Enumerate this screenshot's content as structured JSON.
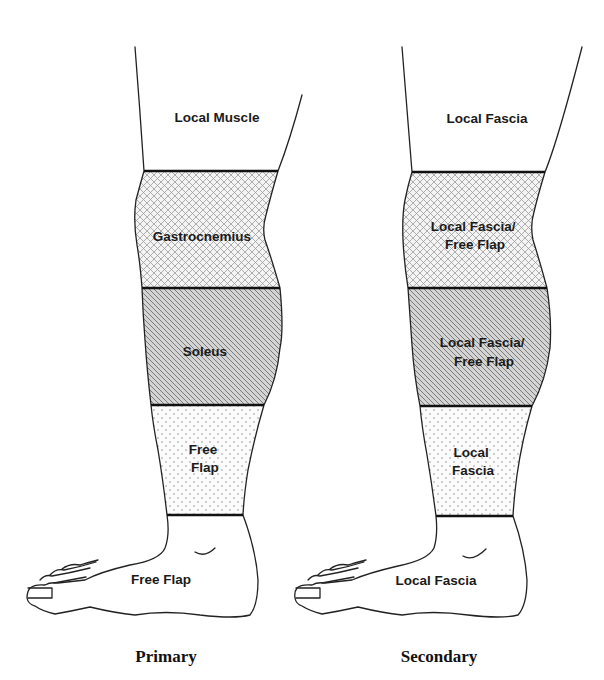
{
  "figure": {
    "type": "anatomical-diagram",
    "patterns": {
      "crosshatch": "gastrocnemius / proximal third",
      "diagonal": "soleus / middle third",
      "dots": "free flap / distal third",
      "none": "knee and foot"
    }
  },
  "primary": {
    "caption": "Primary",
    "zones": [
      {
        "name": "knee",
        "pattern": "none",
        "lines": [
          "Local Muscle"
        ]
      },
      {
        "name": "proximal-third",
        "pattern": "crosshatch",
        "lines": [
          "Gastrocnemius"
        ]
      },
      {
        "name": "middle-third",
        "pattern": "diagonal",
        "lines": [
          "Soleus"
        ]
      },
      {
        "name": "distal-third",
        "pattern": "dots",
        "lines": [
          "Free",
          "Flap"
        ]
      },
      {
        "name": "foot",
        "pattern": "none",
        "lines": [
          "Free Flap"
        ]
      }
    ]
  },
  "secondary": {
    "caption": "Secondary",
    "zones": [
      {
        "name": "knee",
        "pattern": "none",
        "lines": [
          "Local Fascia"
        ]
      },
      {
        "name": "proximal-third",
        "pattern": "crosshatch",
        "lines": [
          "Local Fascia/",
          "Free Flap"
        ]
      },
      {
        "name": "middle-third",
        "pattern": "diagonal",
        "lines": [
          "Local Fascia/",
          "Free Flap"
        ]
      },
      {
        "name": "distal-third",
        "pattern": "dots",
        "lines": [
          "Local",
          "Fascia"
        ]
      },
      {
        "name": "foot",
        "pattern": "none",
        "lines": [
          "Local Fascia"
        ]
      }
    ]
  }
}
